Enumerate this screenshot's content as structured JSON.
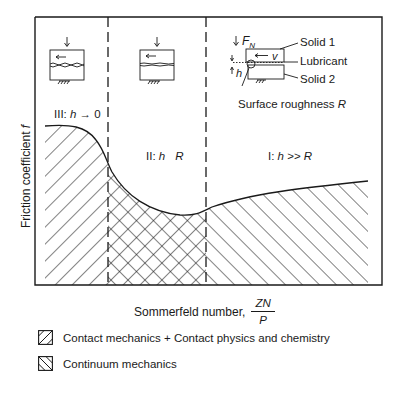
{
  "diagram": {
    "type": "stribeck-curve",
    "y_axis_label": "Friction coefficient f",
    "y_axis_label_text": "Friction coefficient ",
    "y_axis_label_symbol": "f",
    "x_axis_label_text": "Sommerfeld number,",
    "x_axis_fraction": {
      "numerator": "ZN",
      "denominator": "P"
    },
    "regimes": [
      {
        "id": "III",
        "prefix": "III: ",
        "h": "h",
        "relation": " → 0",
        "name": "Boundary lubrication"
      },
      {
        "id": "II",
        "prefix": "II: ",
        "h": "h",
        "relation": "   ",
        "R": "R",
        "name": "Mixed lubrication"
      },
      {
        "id": "I",
        "prefix": "I: ",
        "h": "h",
        "relation": " >> ",
        "R": "R",
        "name": "Hydrodynamic lubrication"
      }
    ],
    "inset_labels": {
      "force": "F",
      "force_sub": "N",
      "velocity": "v",
      "gap": "h",
      "solid1": "Solid 1",
      "lubricant": "Lubricant",
      "solid2": "Solid 2",
      "roughness": "Surface roughness ",
      "roughness_symbol": "R"
    },
    "legend": [
      {
        "pattern": "forward-hatch",
        "label": "Contact mechanics + Contact physics and chemistry"
      },
      {
        "pattern": "back-hatch",
        "label": "Continuum mechanics"
      }
    ],
    "colors": {
      "line": "#1a1a1a",
      "background": "#ffffff"
    }
  }
}
